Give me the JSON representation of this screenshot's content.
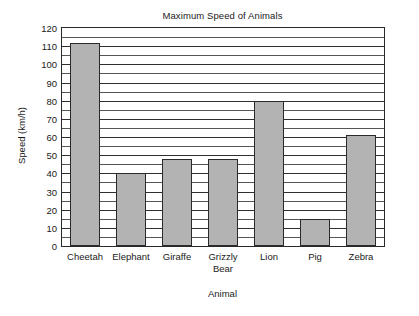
{
  "chart_data": {
    "type": "bar",
    "title": "Maximum Speed of Animals",
    "xlabel": "Animal",
    "ylabel": "Speed (km/h)",
    "categories": [
      "Cheetah",
      "Elephant",
      "Giraffe",
      "Grizzly Bear",
      "Lion",
      "Pig",
      "Zebra"
    ],
    "values": [
      112,
      40,
      48,
      48,
      80,
      15,
      61
    ],
    "ylim": [
      0,
      120
    ],
    "ytick_labels": [
      "0",
      "10",
      "20",
      "30",
      "40",
      "50",
      "60",
      "70",
      "80",
      "90",
      "100",
      "110",
      "120"
    ],
    "ytick_values": [
      0,
      10,
      20,
      30,
      40,
      50,
      60,
      70,
      80,
      90,
      100,
      110,
      120
    ],
    "minor_tick_step": 5,
    "grid": true,
    "grid_axis": "y",
    "legend": null,
    "bar_fill_color": "#b3b3b3",
    "bar_edge_color": "#2a2a2a",
    "plot_background_color": "#ffffff",
    "axes_color": "#2a2a2a"
  },
  "xtick_multiline": [
    [
      "Cheetah"
    ],
    [
      "Elephant"
    ],
    [
      "Giraffe"
    ],
    [
      "Grizzly",
      "Bear"
    ],
    [
      "Lion"
    ],
    [
      "Pig"
    ],
    [
      "Zebra"
    ]
  ]
}
